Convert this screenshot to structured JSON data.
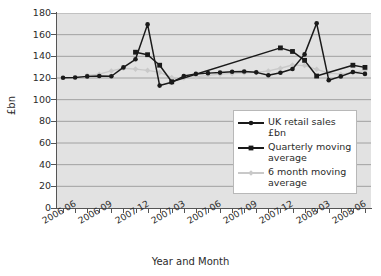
{
  "chart_data": {
    "type": "line",
    "title": "",
    "xlabel": "Year and Month",
    "ylabel": "£bn",
    "ylim": [
      0,
      180
    ],
    "ytick_step": 20,
    "yticks": [
      "0",
      "20",
      "40",
      "60",
      "80",
      "100",
      "120",
      "140",
      "160",
      "180"
    ],
    "grid": true,
    "legend_position": "inside-right-middle",
    "x": [
      "2006 06",
      "2006 07",
      "2006 08",
      "2006 09",
      "2006 10",
      "2006 11",
      "2007 12",
      "2007 01",
      "2007 02",
      "2007 03",
      "2007 04",
      "2007 05",
      "2007 06",
      "2007 07",
      "2007 08",
      "2007 09",
      "2007 10",
      "2007 11",
      "2007 12",
      "2008 01",
      "2008 02",
      "2008 03",
      "2008 04",
      "2008 05",
      "2008 06",
      "2008 07"
    ],
    "xtick_labels": [
      "2006 06",
      "2006 09",
      "2007 12",
      "2007 03",
      "2007 06",
      "2007 09",
      "2007 12",
      "2008 03",
      "2008 06"
    ],
    "xtick_label_indices": [
      0,
      3,
      6,
      9,
      12,
      15,
      18,
      21,
      24
    ],
    "series": [
      {
        "name": "UK retail sales £bn",
        "marker": "circle",
        "color": "#1a1a1a",
        "values": [
          120.2,
          120.5,
          121.5,
          121.8,
          121.6,
          129.8,
          137.3,
          169.5,
          113.0,
          116.0,
          121.8,
          123.8,
          124.5,
          125.0,
          125.8,
          126.0,
          125.2,
          122.5,
          124.8,
          128.3,
          141.8,
          170.5,
          118.0,
          121.5,
          125.5,
          123.8
        ]
      },
      {
        "name": "Quarterly moving average",
        "marker": "square",
        "color": "#1a1a1a",
        "values": [
          null,
          null,
          null,
          null,
          null,
          null,
          143.8,
          141.5,
          131.8,
          116.5,
          null,
          null,
          null,
          null,
          null,
          null,
          null,
          null,
          147.8,
          144.5,
          136.3,
          121.8,
          null,
          null,
          131.8,
          129.8
        ]
      },
      {
        "name": "6 month moving average",
        "marker": "diamond",
        "color": "#c9c9c9",
        "values": [
          null,
          null,
          122.5,
          123.5,
          126.5,
          129.0,
          128.2,
          127.0,
          125.2,
          120.5,
          120.0,
          121.0,
          122.5,
          123.5,
          124.2,
          124.8,
          125.2,
          126.5,
          129.0,
          132.0,
          131.5,
          128.0,
          124.5,
          123.5,
          125.0,
          127.0
        ]
      }
    ]
  },
  "axes": {
    "y_title": "£bn",
    "x_title": "Year and Month"
  },
  "legend": {
    "items": [
      {
        "label": "UK retail sales £bn",
        "marker": "circle",
        "color": "#1a1a1a"
      },
      {
        "label": "Quarterly moving average",
        "marker": "square",
        "color": "#1a1a1a"
      },
      {
        "label": "6 month moving average",
        "marker": "diamond",
        "color": "#c9c9c9"
      }
    ]
  }
}
